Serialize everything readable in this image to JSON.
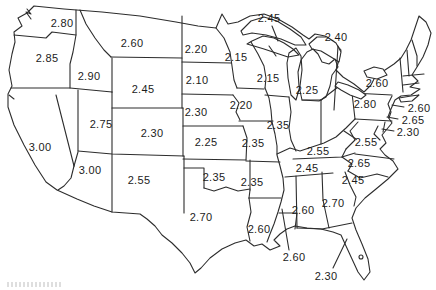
{
  "figure": {
    "type": "us-state-value-map",
    "description_visible_text_only": true
  },
  "colors": {
    "line": "#2d2d2d",
    "label": "#1c1c1c",
    "background": "#ffffff"
  },
  "map": {
    "labels": [
      {
        "state": "washington",
        "value": "2.80",
        "x": 62,
        "y": 23
      },
      {
        "state": "oregon",
        "value": "2.85",
        "x": 47,
        "y": 58
      },
      {
        "state": "idaho",
        "value": "2.90",
        "x": 89,
        "y": 76
      },
      {
        "state": "montana",
        "value": "2.60",
        "x": 132,
        "y": 43
      },
      {
        "state": "wyoming",
        "value": "2.45",
        "x": 143,
        "y": 89
      },
      {
        "state": "north-dakota",
        "value": "2.20",
        "x": 196,
        "y": 49
      },
      {
        "state": "south-dakota",
        "value": "2.10",
        "x": 197,
        "y": 80
      },
      {
        "state": "nebraska",
        "value": "2.30",
        "x": 196,
        "y": 112
      },
      {
        "state": "iowa",
        "value": "2.20",
        "x": 241,
        "y": 105
      },
      {
        "state": "kansas",
        "value": "2.25",
        "x": 206,
        "y": 142
      },
      {
        "state": "colorado",
        "value": "2.30",
        "x": 152,
        "y": 133
      },
      {
        "state": "utah",
        "value": "2.75",
        "x": 101,
        "y": 124
      },
      {
        "state": "california",
        "value": "3.00",
        "x": 40,
        "y": 147
      },
      {
        "state": "arizona",
        "value": "3.00",
        "x": 90,
        "y": 170
      },
      {
        "state": "new-mexico",
        "value": "2.55",
        "x": 139,
        "y": 180
      },
      {
        "state": "oklahoma",
        "value": "2.35",
        "x": 214,
        "y": 177
      },
      {
        "state": "texas",
        "value": "2.70",
        "x": 201,
        "y": 217
      },
      {
        "state": "minnesota",
        "value": "2.15",
        "x": 236,
        "y": 57
      },
      {
        "state": "wisconsin",
        "value": "2.15",
        "x": 268,
        "y": 78
      },
      {
        "state": "michigan",
        "value": "2.25",
        "x": 307,
        "y": 90
      },
      {
        "state": "illinois",
        "value": "2.35",
        "x": 278,
        "y": 125
      },
      {
        "state": "missouri",
        "value": "2.35",
        "x": 253,
        "y": 143
      },
      {
        "state": "arkansas",
        "value": "2.35",
        "x": 252,
        "y": 182
      },
      {
        "state": "louisiana",
        "value": "2.60",
        "x": 259,
        "y": 229
      },
      {
        "state": "kentucky",
        "value": "2.55",
        "x": 318,
        "y": 151
      },
      {
        "state": "tennessee",
        "value": "2.45",
        "x": 307,
        "y": 168
      },
      {
        "state": "new-york",
        "value": "2.60",
        "x": 377,
        "y": 83
      },
      {
        "state": "pennsylvania",
        "value": "2.80",
        "x": 365,
        "y": 104
      },
      {
        "state": "north-carolina",
        "value": "2.65",
        "x": 359,
        "y": 163
      },
      {
        "state": "south-carolina",
        "value": "2.45",
        "x": 353,
        "y": 180
      },
      {
        "state": "georgia",
        "value": "2.70",
        "x": 333,
        "y": 203
      },
      {
        "state": "alabama",
        "value": "2.60",
        "x": 303,
        "y": 210
      }
    ],
    "callouts": [
      {
        "state": "michigan-upper-peninsula",
        "value": "2.45",
        "x": 269,
        "y": 18,
        "line": {
          "x1": 272,
          "y1": 26,
          "x2": 278,
          "y2": 41
        }
      },
      {
        "state": "ohio",
        "value": "2.40",
        "x": 336,
        "y": 37,
        "line": {
          "x1": 338,
          "y1": 46,
          "x2": 334,
          "y2": 110
        }
      },
      {
        "state": "new-jersey",
        "value": "2.60",
        "x": 419,
        "y": 108,
        "line": {
          "x1": 404,
          "y1": 107,
          "x2": 392,
          "y2": 105
        }
      },
      {
        "state": "delaware",
        "value": "2.65",
        "x": 413,
        "y": 120,
        "line": {
          "x1": 398,
          "y1": 119,
          "x2": 387,
          "y2": 117
        }
      },
      {
        "state": "maryland",
        "value": "2.30",
        "x": 408,
        "y": 132,
        "line": {
          "x1": 394,
          "y1": 131,
          "x2": 382,
          "y2": 129
        }
      },
      {
        "state": "west-virginia",
        "value": "2.55",
        "x": 366,
        "y": 142,
        "line": {
          "x1": 356,
          "y1": 139,
          "x2": 344,
          "y2": 131
        }
      },
      {
        "state": "mississippi",
        "value": "2.60",
        "x": 294,
        "y": 257,
        "line": {
          "x1": 289,
          "y1": 250,
          "x2": 282,
          "y2": 209
        }
      },
      {
        "state": "florida",
        "value": "2.30",
        "x": 326,
        "y": 276,
        "line": {
          "x1": 333,
          "y1": 268,
          "x2": 347,
          "y2": 239
        }
      }
    ],
    "unlabeled_states": [
      "nevada",
      "indiana",
      "virginia",
      "vermont",
      "new-hampshire",
      "maine",
      "massachusetts",
      "connecticut",
      "rhode-island"
    ]
  }
}
